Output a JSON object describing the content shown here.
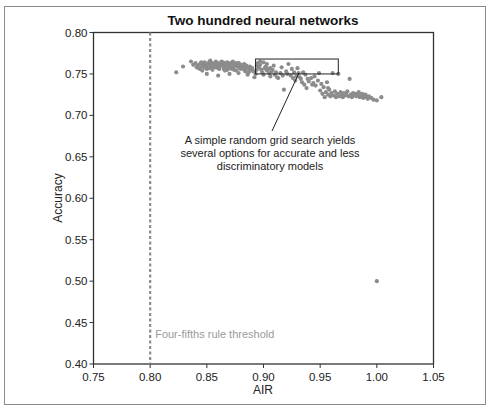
{
  "chart_data": {
    "type": "scatter",
    "title": "Two hundred neural networks",
    "xlabel": "AIR",
    "ylabel": "Accuracy",
    "xlim": [
      0.75,
      1.05
    ],
    "ylim": [
      0.4,
      0.8
    ],
    "xticks": [
      "0.75",
      "0.80",
      "0.85",
      "0.90",
      "0.95",
      "1.00",
      "1.05"
    ],
    "yticks": [
      "0.40",
      "0.45",
      "0.50",
      "0.55",
      "0.60",
      "0.65",
      "0.70",
      "0.75",
      "0.80"
    ],
    "grid": false,
    "legend": null,
    "marker_color": "#8c8c8c",
    "threshold": {
      "x": 0.8,
      "label": "Four-fifths rule threshold",
      "style": "dashed",
      "color": "#8c8c8c"
    },
    "annotation": {
      "lines": [
        "A simple random grid search yields",
        "several options for accurate and less",
        "discriminatory models"
      ],
      "box": {
        "x0": 0.893,
        "x1": 0.966,
        "y0": 0.75,
        "y1": 0.768
      }
    },
    "series": [
      {
        "name": "models",
        "points": [
          [
            0.823,
            0.752
          ],
          [
            0.829,
            0.759
          ],
          [
            0.836,
            0.765
          ],
          [
            0.838,
            0.761
          ],
          [
            0.84,
            0.763
          ],
          [
            0.842,
            0.76
          ],
          [
            0.843,
            0.757
          ],
          [
            0.844,
            0.762
          ],
          [
            0.845,
            0.764
          ],
          [
            0.846,
            0.759
          ],
          [
            0.847,
            0.761
          ],
          [
            0.848,
            0.763
          ],
          [
            0.849,
            0.758
          ],
          [
            0.85,
            0.76
          ],
          [
            0.851,
            0.762
          ],
          [
            0.852,
            0.764
          ],
          [
            0.853,
            0.761
          ],
          [
            0.854,
            0.759
          ],
          [
            0.855,
            0.763
          ],
          [
            0.856,
            0.76
          ],
          [
            0.857,
            0.762
          ],
          [
            0.858,
            0.758
          ],
          [
            0.858,
            0.765
          ],
          [
            0.859,
            0.761
          ],
          [
            0.86,
            0.763
          ],
          [
            0.861,
            0.759
          ],
          [
            0.862,
            0.762
          ],
          [
            0.863,
            0.76
          ],
          [
            0.864,
            0.764
          ],
          [
            0.865,
            0.761
          ],
          [
            0.866,
            0.758
          ],
          [
            0.866,
            0.763
          ],
          [
            0.867,
            0.76
          ],
          [
            0.868,
            0.762
          ],
          [
            0.869,
            0.759
          ],
          [
            0.87,
            0.761
          ],
          [
            0.871,
            0.763
          ],
          [
            0.872,
            0.76
          ],
          [
            0.873,
            0.758
          ],
          [
            0.874,
            0.762
          ],
          [
            0.875,
            0.76
          ],
          [
            0.876,
            0.763
          ],
          [
            0.877,
            0.759
          ],
          [
            0.878,
            0.761
          ],
          [
            0.879,
            0.762
          ],
          [
            0.88,
            0.76
          ],
          [
            0.881,
            0.758
          ],
          [
            0.882,
            0.761
          ],
          [
            0.883,
            0.759
          ],
          [
            0.884,
            0.757
          ],
          [
            0.885,
            0.76
          ],
          [
            0.886,
            0.758
          ],
          [
            0.887,
            0.756
          ],
          [
            0.888,
            0.759
          ],
          [
            0.889,
            0.755
          ],
          [
            0.846,
            0.754
          ],
          [
            0.85,
            0.756
          ],
          [
            0.855,
            0.755
          ],
          [
            0.86,
            0.757
          ],
          [
            0.865,
            0.756
          ],
          [
            0.868,
            0.755
          ],
          [
            0.872,
            0.756
          ],
          [
            0.876,
            0.754
          ],
          [
            0.88,
            0.756
          ],
          [
            0.884,
            0.753
          ],
          [
            0.85,
            0.75
          ],
          [
            0.86,
            0.748
          ],
          [
            0.87,
            0.75
          ],
          [
            0.878,
            0.751
          ],
          [
            0.886,
            0.749
          ],
          [
            0.848,
            0.764
          ],
          [
            0.853,
            0.766
          ],
          [
            0.858,
            0.763
          ],
          [
            0.863,
            0.765
          ],
          [
            0.868,
            0.764
          ],
          [
            0.873,
            0.765
          ],
          [
            0.878,
            0.763
          ],
          [
            0.883,
            0.762
          ],
          [
            0.841,
            0.758
          ],
          [
            0.844,
            0.756
          ],
          [
            0.848,
            0.758
          ],
          [
            0.852,
            0.757
          ],
          [
            0.856,
            0.758
          ],
          [
            0.861,
            0.756
          ],
          [
            0.866,
            0.754
          ],
          [
            0.87,
            0.757
          ],
          [
            0.874,
            0.755
          ],
          [
            0.879,
            0.757
          ],
          [
            0.883,
            0.755
          ],
          [
            0.887,
            0.752
          ],
          [
            0.89,
            0.757
          ],
          [
            0.891,
            0.753
          ],
          [
            0.892,
            0.746
          ],
          [
            0.893,
            0.75
          ],
          [
            0.894,
            0.76
          ],
          [
            0.895,
            0.763
          ],
          [
            0.896,
            0.758
          ],
          [
            0.897,
            0.761
          ],
          [
            0.898,
            0.755
          ],
          [
            0.899,
            0.752
          ],
          [
            0.9,
            0.764
          ],
          [
            0.901,
            0.757
          ],
          [
            0.902,
            0.759
          ],
          [
            0.903,
            0.754
          ],
          [
            0.904,
            0.756
          ],
          [
            0.905,
            0.751
          ],
          [
            0.906,
            0.757
          ],
          [
            0.907,
            0.753
          ],
          [
            0.908,
            0.755
          ],
          [
            0.91,
            0.749
          ],
          [
            0.911,
            0.752
          ],
          [
            0.912,
            0.746
          ],
          [
            0.913,
            0.745
          ],
          [
            0.915,
            0.751
          ],
          [
            0.917,
            0.748
          ],
          [
            0.918,
            0.731
          ],
          [
            0.92,
            0.753
          ],
          [
            0.922,
            0.762
          ],
          [
            0.924,
            0.748
          ],
          [
            0.926,
            0.745
          ],
          [
            0.927,
            0.752
          ],
          [
            0.928,
            0.742
          ],
          [
            0.929,
            0.747
          ],
          [
            0.93,
            0.757
          ],
          [
            0.931,
            0.751
          ],
          [
            0.932,
            0.746
          ],
          [
            0.933,
            0.744
          ],
          [
            0.934,
            0.74
          ],
          [
            0.935,
            0.752
          ],
          [
            0.936,
            0.737
          ],
          [
            0.937,
            0.749
          ],
          [
            0.938,
            0.733
          ],
          [
            0.94,
            0.741
          ],
          [
            0.942,
            0.745
          ],
          [
            0.944,
            0.739
          ],
          [
            0.946,
            0.736
          ],
          [
            0.948,
            0.742
          ],
          [
            0.949,
            0.751
          ],
          [
            0.95,
            0.73
          ],
          [
            0.951,
            0.738
          ],
          [
            0.952,
            0.726
          ],
          [
            0.953,
            0.734
          ],
          [
            0.954,
            0.722
          ],
          [
            0.955,
            0.728
          ],
          [
            0.956,
            0.74
          ],
          [
            0.957,
            0.725
          ],
          [
            0.958,
            0.731
          ],
          [
            0.959,
            0.723
          ],
          [
            0.96,
            0.727
          ],
          [
            0.961,
            0.751
          ],
          [
            0.962,
            0.724
          ],
          [
            0.963,
            0.729
          ],
          [
            0.964,
            0.722
          ],
          [
            0.965,
            0.726
          ],
          [
            0.966,
            0.75
          ],
          [
            0.967,
            0.723
          ],
          [
            0.968,
            0.728
          ],
          [
            0.969,
            0.725
          ],
          [
            0.97,
            0.722
          ],
          [
            0.971,
            0.727
          ],
          [
            0.972,
            0.724
          ],
          [
            0.973,
            0.726
          ],
          [
            0.974,
            0.729
          ],
          [
            0.975,
            0.723
          ],
          [
            0.976,
            0.744
          ],
          [
            0.977,
            0.725
          ],
          [
            0.978,
            0.722
          ],
          [
            0.979,
            0.727
          ],
          [
            0.98,
            0.724
          ],
          [
            0.981,
            0.726
          ],
          [
            0.982,
            0.723
          ],
          [
            0.983,
            0.725
          ],
          [
            0.984,
            0.728
          ],
          [
            0.985,
            0.722
          ],
          [
            0.986,
            0.724
          ],
          [
            0.987,
            0.726
          ],
          [
            0.988,
            0.721
          ],
          [
            0.989,
            0.723
          ],
          [
            0.99,
            0.725
          ],
          [
            0.991,
            0.722
          ],
          [
            0.992,
            0.72
          ],
          [
            0.993,
            0.723
          ],
          [
            0.995,
            0.721
          ],
          [
            0.997,
            0.719
          ],
          [
            1.0,
            0.718
          ],
          [
            1.004,
            0.722
          ],
          [
            0.957,
            0.733
          ],
          [
            0.945,
            0.747
          ],
          [
            0.939,
            0.744
          ],
          [
            0.925,
            0.756
          ],
          [
            0.916,
            0.758
          ],
          [
            0.909,
            0.76
          ],
          [
            0.903,
            0.762
          ],
          [
            0.897,
            0.765
          ],
          [
            0.894,
            0.755
          ],
          [
            0.9,
            0.749
          ],
          [
            0.906,
            0.747
          ],
          [
            0.921,
            0.75
          ],
          [
            0.943,
            0.737
          ],
          [
            1.0,
            0.5
          ]
        ]
      }
    ]
  }
}
